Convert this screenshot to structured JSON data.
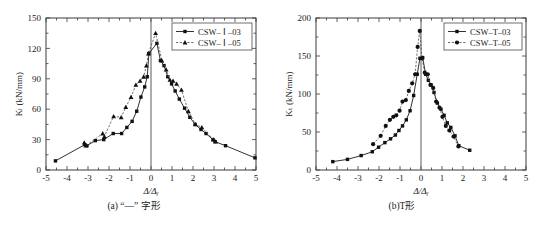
{
  "figure": {
    "panel_count": 2
  },
  "panel_a": {
    "caption": "(a) “—” 字形",
    "ylabel": "Kₗ (kN/mm)",
    "xlabel": "Δ/Δᵧ",
    "legend": [
      {
        "label": "CSW– Ⅰ –03",
        "style": "solid",
        "marker": "square"
      },
      {
        "label": "CSW– Ⅰ –05",
        "style": "dashed",
        "marker": "triangle"
      }
    ],
    "chart_data": {
      "type": "line",
      "title": "",
      "xlabel": "Δ/Δᵧ",
      "ylabel": "Kₗ (kN/mm)",
      "xlim": [
        -5,
        5
      ],
      "ylim": [
        0,
        150
      ],
      "xticks": [
        -5,
        -4,
        -3,
        -2,
        -1,
        0,
        1,
        2,
        3,
        4,
        5
      ],
      "yticks": [
        0,
        30,
        60,
        90,
        120,
        150
      ],
      "xtick_labels": [
        "-5",
        "-4",
        "-3",
        "-2",
        "-1",
        "0",
        "1",
        "2",
        "3",
        "4",
        "5"
      ],
      "ytick_labels": [
        "0",
        "30",
        "60",
        "90",
        "120",
        "150"
      ],
      "grid": false,
      "legend_position": "top-right",
      "series": [
        {
          "name": "CSW– Ⅰ –03",
          "style": "solid",
          "marker": "square",
          "x": [
            -4.55,
            -3.15,
            -3.05,
            -2.65,
            -2.25,
            -1.8,
            -1.4,
            -1.15,
            -0.9,
            -0.68,
            -0.48,
            -0.3,
            -0.18,
            -0.1,
            0.28,
            0.45,
            0.62,
            0.8,
            0.98,
            1.15,
            1.35,
            1.6,
            1.85,
            2.1,
            2.38,
            2.62,
            2.95,
            3.05,
            3.55,
            4.95
          ],
          "y": [
            9,
            25,
            24,
            29,
            30,
            36,
            36,
            42,
            48,
            58,
            72,
            82,
            92,
            115,
            125,
            108,
            103,
            92,
            85,
            78,
            70,
            61,
            52,
            45,
            40,
            36,
            30,
            28,
            24,
            12
          ]
        },
        {
          "name": "CSW– Ⅰ –05",
          "style": "dashed",
          "marker": "triangle",
          "x": [
            -3.18,
            -3.1,
            -2.3,
            -2.22,
            -1.78,
            -1.42,
            -1.2,
            -0.95,
            -0.72,
            -0.52,
            -0.35,
            -0.22,
            -0.12,
            0.22,
            0.52,
            0.72,
            0.9,
            1.05,
            1.22,
            1.45,
            1.78,
            2.12,
            2.42,
            2.98,
            3.08
          ],
          "y": [
            27,
            24,
            36,
            33,
            53,
            52,
            62,
            72,
            84,
            88,
            92,
            103,
            115,
            135,
            108,
            99,
            89,
            88,
            85,
            79,
            58,
            45,
            42,
            30,
            28
          ]
        }
      ]
    }
  },
  "panel_b": {
    "caption": "(b)T形",
    "ylabel": "Kₜ (kN/mm)",
    "xlabel": "Δ/Δᵧ",
    "legend": [
      {
        "label": "CSW–T–03",
        "style": "solid",
        "marker": "square"
      },
      {
        "label": "CSW–T–05",
        "style": "dashed",
        "marker": "circle"
      }
    ],
    "chart_data": {
      "type": "line",
      "title": "",
      "xlabel": "Δ/Δᵧ",
      "ylabel": "Kₜ (kN/mm)",
      "xlim": [
        -5,
        5
      ],
      "ylim": [
        0,
        200
      ],
      "xticks": [
        -5,
        -4,
        -3,
        -2,
        -1,
        0,
        1,
        2,
        3,
        4,
        5
      ],
      "yticks": [
        0,
        50,
        100,
        150,
        200
      ],
      "xtick_labels": [
        "-5",
        "-4",
        "-3",
        "-2",
        "-1",
        "0",
        "1",
        "2",
        "3",
        "4",
        "5"
      ],
      "ytick_labels": [
        "0",
        "50",
        "100",
        "150",
        "200"
      ],
      "grid": false,
      "legend_position": "top-right",
      "series": [
        {
          "name": "CSW–T–03",
          "style": "solid",
          "marker": "square",
          "x": [
            -4.2,
            -3.5,
            -2.85,
            -2.32,
            -2.02,
            -1.72,
            -1.45,
            -1.22,
            -1.05,
            -0.88,
            -0.7,
            -0.52,
            -0.35,
            -0.18,
            -0.05,
            0.08,
            0.22,
            0.35,
            0.48,
            0.62,
            0.78,
            0.95,
            1.1,
            1.25,
            1.42,
            1.62,
            1.8,
            2.32
          ],
          "y": [
            11,
            14,
            19,
            24,
            30,
            36,
            41,
            46,
            52,
            58,
            66,
            78,
            98,
            126,
            147,
            148,
            126,
            118,
            112,
            102,
            88,
            80,
            72,
            62,
            56,
            45,
            32,
            26
          ]
        },
        {
          "name": "CSW–T–05",
          "style": "dashed",
          "marker": "circle",
          "x": [
            -2.28,
            -1.92,
            -1.68,
            -1.48,
            -1.32,
            -1.18,
            -1.02,
            -0.88,
            -0.72,
            -0.58,
            -0.42,
            -0.28,
            -0.16,
            -0.06,
            0.05,
            0.18,
            0.32,
            0.45,
            0.58,
            0.72,
            0.88,
            1.02,
            1.18,
            1.35,
            1.55,
            1.78
          ],
          "y": [
            34,
            45,
            58,
            66,
            70,
            72,
            78,
            90,
            92,
            104,
            114,
            126,
            162,
            183,
            147,
            128,
            126,
            112,
            108,
            90,
            82,
            70,
            58,
            52,
            44,
            31
          ]
        }
      ]
    }
  }
}
